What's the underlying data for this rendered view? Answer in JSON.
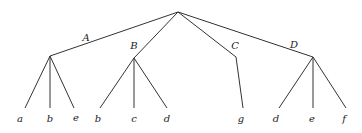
{
  "tree": {
    "root": {
      "x": 178,
      "y": 12
    },
    "internal_nodes": [
      {
        "id": "A",
        "label": "A",
        "x": 50,
        "y": 56,
        "label_x": 86,
        "label_y": 37,
        "children": [
          "a",
          "b",
          "e"
        ]
      },
      {
        "id": "B",
        "label": "B",
        "x": 134,
        "y": 58,
        "label_x": 134,
        "label_y": 45,
        "children": [
          "b",
          "c",
          "d"
        ]
      },
      {
        "id": "C",
        "label": "C",
        "x": 236,
        "y": 57,
        "label_x": 235,
        "label_y": 45,
        "children": [
          "g"
        ]
      },
      {
        "id": "D",
        "label": "D",
        "x": 313,
        "y": 57,
        "label_x": 294,
        "label_y": 44,
        "children": [
          "d",
          "e",
          "f"
        ]
      }
    ],
    "leaves": [
      {
        "label": "a",
        "x": 25,
        "parent": "A"
      },
      {
        "label": "b",
        "x": 50,
        "parent": "A"
      },
      {
        "label": "e",
        "x": 74,
        "parent": "A"
      },
      {
        "label": "b",
        "x": 100,
        "parent": "B"
      },
      {
        "label": "c",
        "x": 134,
        "parent": "B"
      },
      {
        "label": "d",
        "x": 167,
        "parent": "B"
      },
      {
        "label": "g",
        "x": 243,
        "parent": "C"
      },
      {
        "label": "d",
        "x": 279,
        "parent": "D"
      },
      {
        "label": "e",
        "x": 313,
        "parent": "D"
      },
      {
        "label": "f",
        "x": 346,
        "parent": "D"
      }
    ],
    "leaf_line_y": 108,
    "leaf_label_y": 118,
    "stroke_color": "#333333"
  }
}
